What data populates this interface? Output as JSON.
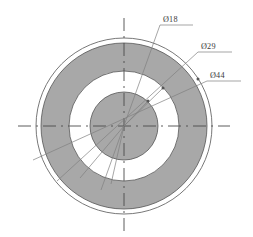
{
  "drawing": {
    "title": "Concentric circular part cross-section",
    "view_type": "front-view",
    "units": "mm",
    "center": {
      "x": 124,
      "y": 126
    },
    "colors": {
      "annulus_fill": "#a8a8a8",
      "inner_disc_fill": "#a8a8a8",
      "gap_ring_fill": "#ffffff",
      "outline": "#555555",
      "centerline": "#4a4a4a",
      "leader_line": "#808080",
      "text": "#3a3a3a",
      "background": "#ffffff"
    },
    "circles": [
      {
        "name": "outermost-boundary-circle",
        "radius": 88,
        "fill": "none",
        "label": null
      },
      {
        "name": "outer-dimension-circle",
        "radius": 83,
        "fill": "#a8a8a8",
        "label": "Ø44"
      },
      {
        "name": "middle-dimension-circle",
        "radius": 55,
        "fill": "#ffffff",
        "label": "Ø29"
      },
      {
        "name": "inner-dimension-circle",
        "radius": 34,
        "fill": "#a8a8a8",
        "label": "Ø18"
      }
    ],
    "dimensions": [
      {
        "id": "dim-18",
        "label": "Ø18",
        "diameter": 18,
        "text_x": 163,
        "text_y": 22,
        "shelf_x1": 160,
        "shelf_x2": 193,
        "shelf_y": 25,
        "arrow_x": 148,
        "arrow_y": 101
      },
      {
        "id": "dim-29",
        "label": "Ø29",
        "diameter": 29,
        "text_x": 201,
        "text_y": 49,
        "shelf_x1": 198,
        "shelf_x2": 232,
        "shelf_y": 52,
        "arrow_x": 163,
        "arrow_y": 88
      },
      {
        "id": "dim-44",
        "label": "Ø44",
        "diameter": 44,
        "text_x": 210,
        "text_y": 78,
        "shelf_x1": 207,
        "shelf_x2": 241,
        "shelf_y": 81,
        "arrow_x": 198,
        "arrow_y": 79
      }
    ],
    "centerlines": {
      "horizontal": {
        "x1": 18,
        "x2": 230,
        "y": 126
      },
      "vertical": {
        "x": 124,
        "y1": 18,
        "y2": 232
      }
    }
  }
}
